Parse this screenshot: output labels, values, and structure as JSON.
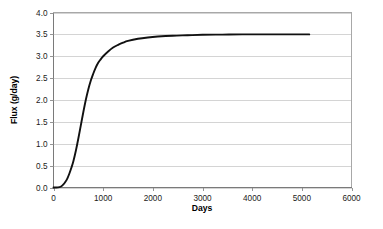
{
  "chart_data": {
    "type": "line",
    "title": "",
    "subtitle": "",
    "xlabel": "Days",
    "ylabel": "Flux (g/day)",
    "xlim": [
      0,
      6000
    ],
    "ylim": [
      0,
      4.0
    ],
    "xticks": [
      0,
      1000,
      2000,
      3000,
      4000,
      5000,
      6000
    ],
    "xtick_labels": [
      "0",
      "1000",
      "2000",
      "3000",
      "4000",
      "5000",
      "6000"
    ],
    "yticks": [
      0.0,
      0.5,
      1.0,
      1.5,
      2.0,
      2.5,
      3.0,
      3.5,
      4.0
    ],
    "ytick_labels": [
      "0.0",
      "0.5",
      "1.0",
      "1.5",
      "2.0",
      "2.5",
      "3.0",
      "3.5",
      "4.0"
    ],
    "grid": "horizontal",
    "legend": null,
    "legend_position": "none",
    "annotations": [],
    "series": [
      {
        "name": "Flux",
        "color": "#111111",
        "x": [
          0,
          60,
          120,
          160,
          200,
          240,
          280,
          320,
          360,
          400,
          450,
          500,
          550,
          600,
          650,
          700,
          750,
          800,
          850,
          900,
          950,
          1000,
          1100,
          1200,
          1300,
          1400,
          1500,
          1700,
          1900,
          2100,
          2400,
          2700,
          3000,
          3400,
          3800,
          4200,
          4600,
          5000,
          5150
        ],
        "y": [
          0.0,
          0.0,
          0.01,
          0.03,
          0.07,
          0.13,
          0.21,
          0.32,
          0.45,
          0.6,
          0.84,
          1.12,
          1.42,
          1.72,
          2.0,
          2.24,
          2.44,
          2.6,
          2.74,
          2.85,
          2.93,
          3.0,
          3.11,
          3.2,
          3.26,
          3.31,
          3.35,
          3.4,
          3.43,
          3.45,
          3.47,
          3.48,
          3.49,
          3.495,
          3.5,
          3.5,
          3.5,
          3.5,
          3.5
        ]
      }
    ],
    "asymptote": 3.5,
    "curve_end_x": 5150
  },
  "axes": {
    "x_axis_title": "Days",
    "y_axis_title": "Flux (g/day)"
  },
  "colors": {
    "curve": "#111111",
    "gridline": "#c9c9c9",
    "border": "#a8a8a8",
    "background": "#ffffff",
    "text": "#1a1a1a"
  }
}
